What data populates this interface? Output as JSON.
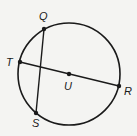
{
  "diagram": {
    "type": "geometry-circle",
    "circle": {
      "center": "U",
      "cx": 69,
      "cy": 74,
      "r": 51
    },
    "colors": {
      "stroke": "#1a1a1a",
      "background": "#f4f4f2"
    },
    "points": [
      {
        "name": "Q",
        "x": 44,
        "y": 29,
        "label_x": 39,
        "label_y": 20
      },
      {
        "name": "T",
        "x": 20,
        "y": 62,
        "label_x": 6,
        "label_y": 66
      },
      {
        "name": "U",
        "x": 69,
        "y": 74,
        "label_x": 64,
        "label_y": 90
      },
      {
        "name": "R",
        "x": 119,
        "y": 86,
        "label_x": 124,
        "label_y": 95
      },
      {
        "name": "S",
        "x": 36,
        "y": 113,
        "label_x": 32,
        "label_y": 127
      }
    ],
    "segments": [
      {
        "from": "T",
        "to": "R",
        "kind": "diameter"
      },
      {
        "from": "Q",
        "to": "S",
        "kind": "chord"
      }
    ],
    "labels": {
      "Q": "Q",
      "T": "T",
      "U": "U",
      "R": "R",
      "S": "S"
    }
  }
}
